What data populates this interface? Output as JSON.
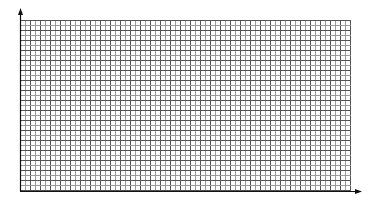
{
  "diagram": {
    "type": "graph-paper-grid",
    "background": "#ffffff",
    "grid": {
      "x_start": 20,
      "y_start": 20,
      "x_end": 351,
      "y_end": 191,
      "cell_size": 5,
      "minor_color": "#9a9a9a",
      "major_color": "#555555",
      "major_every": 2
    },
    "axes": {
      "color": "#111111",
      "y_axis": {
        "x": 20,
        "from_y": 191,
        "to_y": 8,
        "arrow": "up"
      },
      "x_axis": {
        "y": 191,
        "from_x": 20,
        "to_x": 362,
        "arrow": "right"
      }
    },
    "labels": []
  }
}
